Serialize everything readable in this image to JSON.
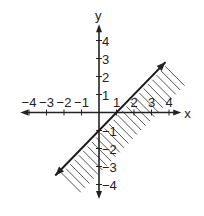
{
  "header_fragment": "y    g   p",
  "graph": {
    "x_axis_label": "x",
    "y_axis_label": "y",
    "x_range": [
      -4.5,
      4.7
    ],
    "y_range": [
      -4.8,
      4.9
    ],
    "x_ticks": [
      {
        "value": -4,
        "label": "−4"
      },
      {
        "value": -3,
        "label": "−3"
      },
      {
        "value": -2,
        "label": "−2"
      },
      {
        "value": -1,
        "label": "−1"
      },
      {
        "value": 1,
        "label": "1"
      },
      {
        "value": 2,
        "label": "2"
      },
      {
        "value": 3,
        "label": "3"
      },
      {
        "value": 4,
        "label": "4"
      }
    ],
    "y_ticks": [
      {
        "value": 4,
        "label": "4"
      },
      {
        "value": 3,
        "label": "3"
      },
      {
        "value": 2,
        "label": "2"
      },
      {
        "value": 1,
        "label": "1"
      },
      {
        "value": -1,
        "label": "−1"
      },
      {
        "value": -2,
        "label": "−2"
      },
      {
        "value": -3,
        "label": "−3"
      },
      {
        "value": -4,
        "label": "−4"
      }
    ],
    "boundary_line": {
      "slope": 1,
      "intercept": -1,
      "x_from": -2.5,
      "x_to": 3.8,
      "style": "solid",
      "arrows": "both"
    },
    "shaded_side": "below-right",
    "inequality": "y ≤ x − 1",
    "shading_style": "hatched"
  }
}
